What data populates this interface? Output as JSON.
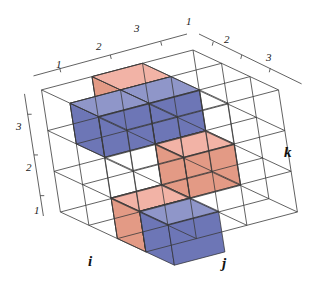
{
  "figure": {
    "axes": {
      "i": {
        "label": "i",
        "ticks": [
          "1",
          "2",
          "3"
        ]
      },
      "j": {
        "label": "j",
        "ticks": [
          "1",
          "2",
          "3"
        ]
      },
      "k": {
        "label": "k",
        "ticks": [
          "1",
          "2",
          "3"
        ]
      }
    },
    "colors": {
      "pink_top": "#f2b3a6",
      "pink_side_light": "#e39a85",
      "pink_side_dark": "#6b3423",
      "blue_top": "#8f96c9",
      "blue_side_light": "#6d76b6",
      "blue_side_dark": "#1f2d72",
      "grid": "#3a3a3a"
    },
    "cubes": [
      {
        "i": 1,
        "j": 0,
        "k": 0,
        "color": "pink"
      },
      {
        "i": 1,
        "j": 1,
        "k": 0,
        "color": "blue"
      },
      {
        "i": 2,
        "j": 1,
        "k": 0,
        "color": "blue"
      },
      {
        "i": 1,
        "j": 2,
        "k": 1,
        "color": "pink"
      },
      {
        "i": 2,
        "j": 2,
        "k": 2,
        "color": "pink"
      },
      {
        "i": 2,
        "j": 3,
        "k": 2,
        "color": "blue"
      }
    ]
  }
}
